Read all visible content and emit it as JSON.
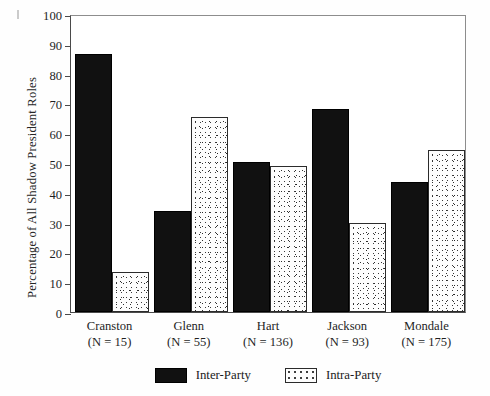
{
  "chart_data": {
    "type": "bar",
    "title": "",
    "xlabel": "",
    "ylabel": "Percentage of All Shadow President Roles",
    "ylim": [
      0,
      100
    ],
    "yticks": [
      0,
      10,
      20,
      30,
      40,
      50,
      60,
      70,
      80,
      90,
      100
    ],
    "grid": false,
    "legend_position": "bottom-center",
    "categories": [
      "Cranston",
      "Glenn",
      "Hart",
      "Jackson",
      "Mondale"
    ],
    "category_sublabels": [
      "(N = 15)",
      "(N = 55)",
      "(N = 136)",
      "(N = 93)",
      "(N = 175)"
    ],
    "series": [
      {
        "name": "Inter-Party",
        "color": "#111111",
        "values": [
          86.5,
          34.0,
          50.5,
          68.0,
          43.5
        ]
      },
      {
        "name": "Intra-Party",
        "color": "#fdfdfd",
        "values": [
          13.5,
          65.5,
          49.0,
          30.0,
          54.5
        ]
      }
    ]
  },
  "legend": {
    "items": [
      {
        "label": "Inter-Party",
        "style": "solid-black"
      },
      {
        "label": "Intra-Party",
        "style": "stippled"
      }
    ]
  },
  "axis": {
    "y_title": "Percentage of All Shadow President Roles",
    "tick_labels": [
      "100",
      "90",
      "80",
      "70",
      "60",
      "50",
      "40",
      "30",
      "20",
      "10",
      "0"
    ]
  },
  "categories": [
    {
      "name": "Cranston",
      "n_label": "(N = 15)",
      "inter": 86.5,
      "intra": 13.5
    },
    {
      "name": "Glenn",
      "n_label": "(N = 55)",
      "inter": 34.0,
      "intra": 65.5
    },
    {
      "name": "Hart",
      "n_label": "(N = 136)",
      "inter": 50.5,
      "intra": 49.0
    },
    {
      "name": "Jackson",
      "n_label": "(N = 93)",
      "inter": 68.0,
      "intra": 30.0
    },
    {
      "name": "Mondale",
      "n_label": "(N = 175)",
      "inter": 43.5,
      "intra": 54.5
    }
  ]
}
